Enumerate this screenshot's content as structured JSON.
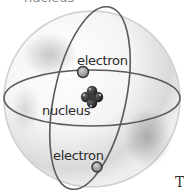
{
  "diagram": {
    "title_cut": "nucleus",
    "labels": {
      "electron_top": "electron",
      "nucleus": "nucleus",
      "electron_bottom": "electron"
    },
    "corner_text": "T",
    "colors": {
      "sphere_stroke": "#c8c8c8",
      "sphere_shade": "#9a9a9a",
      "orbit_stroke": "#555555",
      "nucleus_fill": "#2b2b2b",
      "electron_fill": "#9a9a9a",
      "electron_stroke": "#333333"
    }
  }
}
